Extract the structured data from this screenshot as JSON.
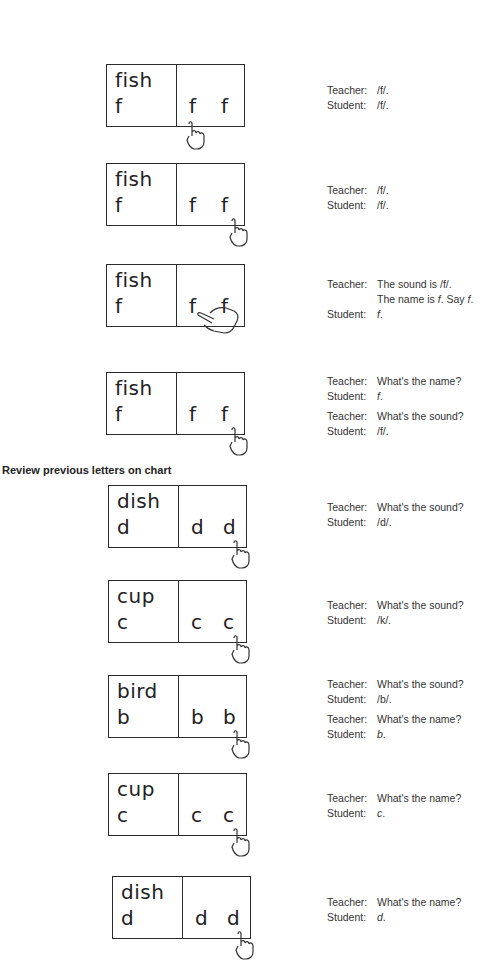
{
  "section_heading": "Review previous letters on chart",
  "cards": [
    {
      "word": "fish",
      "key_letter": "f",
      "letter_a": "f",
      "letter_b": "f",
      "pointing": "first letter, from below"
    },
    {
      "word": "fish",
      "key_letter": "f",
      "letter_a": "f",
      "letter_b": "f",
      "pointing": "second letter, from below"
    },
    {
      "word": "fish",
      "key_letter": "f",
      "letter_a": "f",
      "letter_b": "f",
      "pointing": "sliding from first to second letter"
    },
    {
      "word": "fish",
      "key_letter": "f",
      "letter_a": "f",
      "letter_b": "f",
      "pointing": "second letter, from below"
    },
    {
      "word": "dish",
      "key_letter": "d",
      "letter_a": "d",
      "letter_b": "d",
      "pointing": "second letter, from below"
    },
    {
      "word": "cup",
      "key_letter": "c",
      "letter_a": "c",
      "letter_b": "c",
      "pointing": "second letter, from below"
    },
    {
      "word": "bird",
      "key_letter": "b",
      "letter_a": "b",
      "letter_b": "b",
      "pointing": "second letter, from below"
    },
    {
      "word": "cup",
      "key_letter": "c",
      "letter_a": "c",
      "letter_b": "c",
      "pointing": "second letter, from below"
    },
    {
      "word": "dish",
      "key_letter": "d",
      "letter_a": "d",
      "letter_b": "d",
      "pointing": "second letter, from below"
    }
  ],
  "dialogs": [
    {
      "lines": [
        {
          "speaker": "Teacher:",
          "text": "/f/."
        },
        {
          "speaker": "Student:",
          "text": "/f/."
        }
      ]
    },
    {
      "lines": [
        {
          "speaker": "Teacher:",
          "text": "/f/."
        },
        {
          "speaker": "Student:",
          "text": "/f/."
        }
      ]
    },
    {
      "lines": [
        {
          "speaker": "Teacher:",
          "text": "The sound is /f/."
        },
        {
          "speaker": "",
          "text_pre": "The name is ",
          "text_it": "f",
          "text_mid": ". Say ",
          "text_it2": "f",
          "text_post": "."
        },
        {
          "speaker": "Student:",
          "text_it": "f",
          "text_post": "."
        }
      ]
    },
    {
      "lines": [
        {
          "speaker": "Teacher:",
          "text": "What's the name?"
        },
        {
          "speaker": "Student:",
          "text_it": "f",
          "text_post": "."
        },
        {
          "speaker": "Teacher:",
          "text": "What's the sound?"
        },
        {
          "speaker": "Student:",
          "text": "/f/."
        }
      ]
    },
    {
      "lines": [
        {
          "speaker": "Teacher:",
          "text": "What's the sound?"
        },
        {
          "speaker": "Student:",
          "text": "/d/."
        }
      ]
    },
    {
      "lines": [
        {
          "speaker": "Teacher:",
          "text": "What's the sound?"
        },
        {
          "speaker": "Student:",
          "text": "/k/."
        }
      ]
    },
    {
      "lines": [
        {
          "speaker": "Teacher:",
          "text": "What's the sound?"
        },
        {
          "speaker": "Student:",
          "text": "/b/."
        },
        {
          "speaker": "Teacher:",
          "text": "What's the name?"
        },
        {
          "speaker": "Student:",
          "text_it": "b",
          "text_post": "."
        }
      ]
    },
    {
      "lines": [
        {
          "speaker": "Teacher:",
          "text": "What's the name?"
        },
        {
          "speaker": "Student:",
          "text_it": "c",
          "text_post": "."
        }
      ]
    },
    {
      "lines": [
        {
          "speaker": "Teacher:",
          "text": "What's the name?"
        },
        {
          "speaker": "Student:",
          "text_it": "d",
          "text_post": "."
        }
      ]
    }
  ]
}
